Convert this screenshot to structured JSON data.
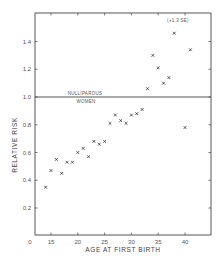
{
  "chart_data": {
    "type": "scatter",
    "title": "",
    "xlabel": "AGE AT FIRST BIRTH",
    "ylabel": "RELATIVE RISK",
    "xlim": [
      12,
      44
    ],
    "ylim": [
      0,
      1.6
    ],
    "x_ticks": [
      15,
      20,
      25,
      30,
      35,
      40
    ],
    "x_tick_labels": [
      "15",
      "20",
      "25",
      "30",
      "35",
      "40"
    ],
    "x_origin_label": "0",
    "y_ticks": [
      0.2,
      0.4,
      0.6,
      0.8,
      1.0,
      1.2,
      1.4
    ],
    "y_tick_labels": [
      "0.2",
      "0.4",
      "0.6",
      "0.8",
      "1.0",
      "1.2",
      "1.4"
    ],
    "grid": false,
    "reference_line": {
      "y": 1.0,
      "label_above": "NULLIPAROUS",
      "label_below": "WOMEN"
    },
    "annotations": [
      {
        "text": "(+1.3 SE)",
        "x": 38,
        "y": 1.55
      }
    ],
    "marker": "x",
    "series": [
      {
        "name": "Relative risk",
        "x": [
          14,
          15,
          16,
          17,
          18,
          19,
          20,
          21,
          22,
          23,
          24,
          25,
          26,
          27,
          28,
          29,
          30,
          31,
          32,
          33,
          34,
          35,
          36,
          37,
          38,
          40,
          41
        ],
        "y": [
          0.35,
          0.47,
          0.55,
          0.45,
          0.53,
          0.53,
          0.6,
          0.63,
          0.57,
          0.68,
          0.66,
          0.68,
          0.81,
          0.87,
          0.83,
          0.81,
          0.87,
          0.88,
          0.91,
          1.06,
          1.3,
          1.21,
          1.1,
          1.14,
          1.46,
          0.78,
          1.34
        ]
      }
    ]
  }
}
